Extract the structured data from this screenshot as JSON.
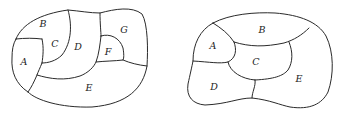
{
  "figure": {
    "type": "map-coloring-diagram",
    "colors": {
      "stroke": "#2a2a2a",
      "text": "#222222",
      "background": "#ffffff"
    },
    "maps": [
      {
        "id": "left-map",
        "regions": [
          {
            "label": "A",
            "x": 24,
            "y": 61
          },
          {
            "label": "B",
            "x": 43,
            "y": 23
          },
          {
            "label": "C",
            "x": 55,
            "y": 43
          },
          {
            "label": "D",
            "x": 78,
            "y": 46
          },
          {
            "label": "E",
            "x": 89,
            "y": 87
          },
          {
            "label": "F",
            "x": 108,
            "y": 51
          },
          {
            "label": "G",
            "x": 124,
            "y": 29
          }
        ]
      },
      {
        "id": "right-map",
        "regions": [
          {
            "label": "A",
            "x": 213,
            "y": 45
          },
          {
            "label": "B",
            "x": 262,
            "y": 29
          },
          {
            "label": "C",
            "x": 256,
            "y": 61
          },
          {
            "label": "D",
            "x": 214,
            "y": 86
          },
          {
            "label": "E",
            "x": 299,
            "y": 78
          }
        ]
      }
    ]
  }
}
